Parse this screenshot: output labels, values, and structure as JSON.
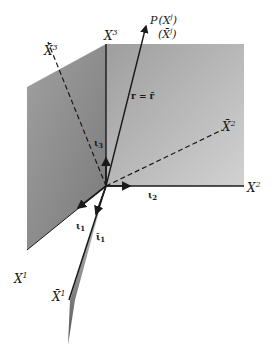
{
  "diagram": {
    "type": "coordinate-axes-3d",
    "colors": {
      "background": "#ffffff",
      "plane_right": "#b5b5b5",
      "plane_left": "#8f8f8f",
      "line": "#1a1a1a"
    },
    "labels": {
      "x1": "X",
      "x1_sup": "1",
      "x2": "X",
      "x2_sup": "2",
      "x3": "X",
      "x3_sup": "3",
      "xbar1": "X̄",
      "xbar1_sup": "1",
      "xbar2": "X̄",
      "xbar2_sup": "2",
      "xbar3": "X̄",
      "xbar3_sup": "3",
      "point_p": "P",
      "p_coords": "(X",
      "p_coords_sup": "j",
      "p_coords_close": ")",
      "p_bar_coords": "(X̄",
      "p_bar_coords_sup": "j",
      "p_bar_coords_close": ")",
      "vector_eq": "r = r̄",
      "iota1": "ι",
      "iota1_sub": "1",
      "iota2": "ι",
      "iota2_sub": "2",
      "iota3": "ι",
      "iota3_sub": "3",
      "iotabar1": "ῑ",
      "iotabar1_sub": "1"
    }
  }
}
